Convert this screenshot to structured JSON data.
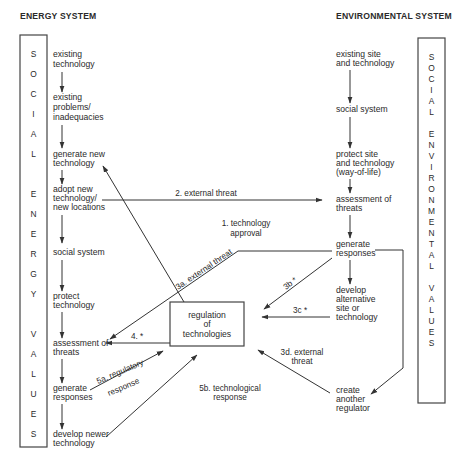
{
  "headers": {
    "left": "ENERGY SYSTEM",
    "right": "ENVIRONMENTAL SYSTEM"
  },
  "side_boxes": {
    "left": {
      "label": "SOCIAL ENERGY VALUES",
      "letters": [
        "S",
        "O",
        "C",
        "I",
        "A",
        "L",
        "",
        "E",
        "N",
        "E",
        "R",
        "G",
        "Y",
        "",
        "V",
        "A",
        "L",
        "U",
        "E",
        "S"
      ]
    },
    "right": {
      "label": "SOCIAL ENVIRONMENTAL VALUES",
      "letters": [
        "S",
        "O",
        "C",
        "I",
        "A",
        "L",
        "",
        "E",
        "N",
        "V",
        "I",
        "R",
        "O",
        "N",
        "M",
        "E",
        "N",
        "T",
        "A",
        "L",
        "",
        "V",
        "A",
        "L",
        "U",
        "E",
        "S"
      ]
    }
  },
  "energy_nodes": [
    {
      "id": "e1",
      "lines": [
        "existing",
        "technology"
      ]
    },
    {
      "id": "e2",
      "lines": [
        "existing",
        "problems/",
        "inadequacies"
      ]
    },
    {
      "id": "e3",
      "lines": [
        "generate new",
        "technology"
      ]
    },
    {
      "id": "e4",
      "lines": [
        "adopt new",
        "technology/",
        "new locations"
      ]
    },
    {
      "id": "e5",
      "lines": [
        "social system"
      ]
    },
    {
      "id": "e6",
      "lines": [
        "protect",
        "technology"
      ]
    },
    {
      "id": "e7",
      "lines": [
        "assessment of",
        "threats"
      ]
    },
    {
      "id": "e8",
      "lines": [
        "generate",
        "responses"
      ]
    },
    {
      "id": "e9",
      "lines": [
        "develop newer",
        "technology"
      ]
    }
  ],
  "environment_nodes": [
    {
      "id": "v1",
      "lines": [
        "existing site",
        "and technology"
      ]
    },
    {
      "id": "v2",
      "lines": [
        "social system"
      ]
    },
    {
      "id": "v3",
      "lines": [
        "protect site",
        "and technology",
        "(way-of-life)"
      ]
    },
    {
      "id": "v4",
      "lines": [
        "assessment of",
        "threats"
      ]
    },
    {
      "id": "v5",
      "lines": [
        "generate",
        "responses"
      ]
    },
    {
      "id": "v6",
      "lines": [
        "develop",
        "alternative",
        "site or",
        "technology"
      ]
    },
    {
      "id": "v7",
      "lines": [
        "create",
        "another",
        "regulator"
      ]
    }
  ],
  "center_node": {
    "lines": [
      "regulation",
      "of",
      "technologies"
    ]
  },
  "edge_labels": {
    "tech_approval": [
      "1. technology",
      "approval"
    ],
    "ext_threat_2": "2. external threat",
    "ext_threat_3a": "3a. external threat",
    "label_3b": "3b *",
    "label_3c": "3c *",
    "ext_threat_3d": [
      "3d. external",
      "threat"
    ],
    "label_4": "4. *",
    "reg_response_5a": [
      "5a. regulatory",
      "response"
    ],
    "tech_response_5b": [
      "5b. technological",
      "response"
    ]
  }
}
